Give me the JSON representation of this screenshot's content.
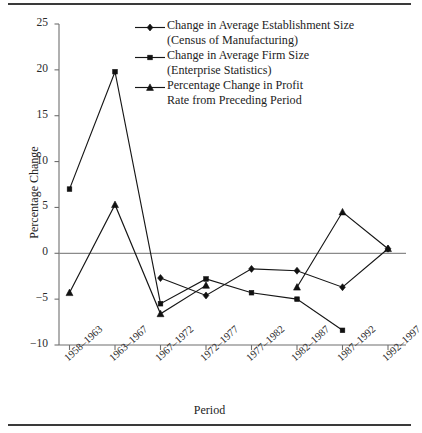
{
  "chart_data": {
    "type": "line",
    "title": "",
    "xlabel": "Period",
    "ylabel": "Percentage Change",
    "categories": [
      "1958–1963",
      "1963–1967",
      "1967–1972",
      "1972–1977",
      "1977–1982",
      "1982–1987",
      "1987–1992",
      "1992–1997"
    ],
    "ylim": [
      -10,
      25
    ],
    "yticks": [
      -10,
      -5,
      0,
      5,
      10,
      15,
      20,
      25
    ],
    "ytick_labels": [
      "−10",
      "−5",
      "0",
      "5",
      "10",
      "15",
      "20",
      "25"
    ],
    "grid": false,
    "zero_line": true,
    "legend_position": "top-right",
    "series": [
      {
        "name": "Change in Average Establishment Size\n(Census of Manufacturing)",
        "marker": "diamond",
        "values": [
          null,
          null,
          -2.7,
          -4.6,
          -1.7,
          -1.9,
          -3.7,
          0.5
        ]
      },
      {
        "name": "Change in  Average Firm  Size\n(Enterprise Statistics)",
        "marker": "square",
        "values": [
          7.0,
          19.8,
          -5.5,
          -2.8,
          -4.3,
          -5.0,
          -8.4,
          null
        ]
      },
      {
        "name": "Percentage Change in Profit\nRate from Preceding Period",
        "marker": "triangle",
        "values": [
          -4.3,
          5.3,
          -6.6,
          -3.5,
          null,
          -3.7,
          4.5,
          0.5
        ]
      }
    ]
  },
  "legend": {
    "items": [
      {
        "marker": "diamond",
        "label": "Change in Average Establishment Size\n(Census of Manufacturing)"
      },
      {
        "marker": "square",
        "label": "Change in  Average Firm  Size\n(Enterprise Statistics)"
      },
      {
        "marker": "triangle",
        "label": "Percentage Change in Profit\nRate from Preceding Period"
      }
    ]
  },
  "axes": {
    "x_title": "Period",
    "y_title": "Percentage Change"
  },
  "colors": {
    "ink": "#111111",
    "axis": "#6f6f6f",
    "rule": "#3a3a3a"
  }
}
